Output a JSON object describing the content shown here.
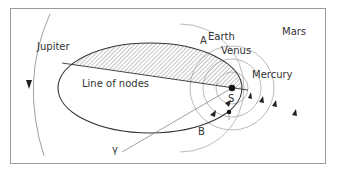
{
  "diagram": {
    "type": "orbital-diagram",
    "labels": {
      "jupiter": "Jupiter",
      "mars": "Mars",
      "earth": "Earth",
      "venus": "Venus",
      "mercury": "Mercury",
      "sun": "S",
      "point_a": "A",
      "point_b": "B",
      "line_of_nodes": "Line of nodes",
      "gamma": "γ"
    },
    "colors": {
      "frame": "#999999",
      "orbit_circles": "#aaaaaa",
      "comet_orbit": "#333333",
      "hatch": "#555555",
      "text": "#333333"
    }
  }
}
